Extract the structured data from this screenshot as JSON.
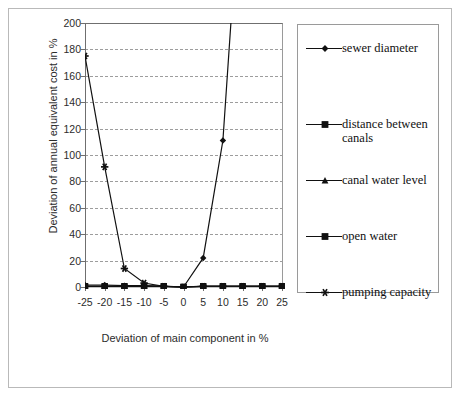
{
  "chart_data": {
    "type": "line",
    "title": "",
    "xlabel": "Deviation of main component in %",
    "ylabel": "Deviation of annual equivalent cost in %",
    "x": [
      -25,
      -20,
      -15,
      -10,
      -5,
      0,
      5,
      10,
      15,
      20,
      25
    ],
    "xtick_labels": [
      "-25",
      "-20",
      "-15",
      "-10",
      "-5",
      "0",
      "5",
      "10",
      "15",
      "20",
      "25"
    ],
    "ytick_labels": [
      "0",
      "20",
      "40",
      "60",
      "80",
      "100",
      "120",
      "140",
      "160",
      "180",
      "200"
    ],
    "ylim": [
      0,
      200
    ],
    "ytick_step": 20,
    "grid": "horizontal-dashed",
    "legend_position": "right-outside",
    "series": [
      {
        "name": "sewer diameter",
        "marker": "diamond",
        "values": [
          1.5,
          1.5,
          1.0,
          1.0,
          0.5,
          0.0,
          22,
          111,
          330,
          330,
          330
        ]
      },
      {
        "name": "distance between canals",
        "marker": "square",
        "values": [
          0.6,
          0.6,
          0.6,
          0.6,
          0.6,
          0.0,
          0.6,
          0.6,
          0.6,
          0.6,
          0.6
        ]
      },
      {
        "name": "canal water level",
        "marker": "triangle",
        "values": [
          0.4,
          0.4,
          0.4,
          0.4,
          0.4,
          0.0,
          0.4,
          0.4,
          0.4,
          0.4,
          0.4
        ]
      },
      {
        "name": "open water",
        "marker": "square",
        "values": [
          0.2,
          0.2,
          0.2,
          0.2,
          0.2,
          0.0,
          0.2,
          0.2,
          0.2,
          0.2,
          0.2
        ]
      },
      {
        "name": "pumping capacity",
        "marker": "star",
        "values": [
          175,
          91,
          14,
          3,
          0.5,
          0.0,
          0.5,
          0.5,
          0.5,
          0.5,
          0.5
        ]
      }
    ],
    "colors": {
      "series_line": "#111111",
      "axis": "#6f6f6f",
      "grid": "#9d9d9d",
      "frame": "#b9b9b9",
      "text": "#2c2c2c"
    }
  },
  "legend": {
    "entries": [
      {
        "label": "sewer diameter",
        "marker": "diamond"
      },
      {
        "label": "distance between canals",
        "marker": "square"
      },
      {
        "label": "canal water level",
        "marker": "triangle"
      },
      {
        "label": "open water",
        "marker": "square"
      },
      {
        "label": "pumping capacity",
        "marker": "star"
      }
    ]
  }
}
